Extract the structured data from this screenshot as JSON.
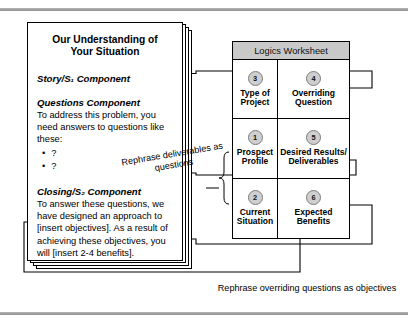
{
  "document": {
    "title": "Our Understanding of Your Situation",
    "sections": [
      {
        "heading": "Story/S₁ Component",
        "body": ""
      },
      {
        "heading": "Questions Component",
        "body": "To address this problem, you need answers to questions like these:",
        "bullets": [
          "?",
          "?"
        ]
      },
      {
        "heading": "Closing/S₂ Component",
        "body": "To answer these questions, we have designed an approach to [insert objectives]. As a result of achieving these objectives, you will [insert 2-4 benefits]."
      }
    ]
  },
  "worksheet": {
    "header": "Logics Worksheet",
    "cells": [
      {
        "number": "3",
        "label": "Type of Project"
      },
      {
        "number": "4",
        "label": "Overriding Question"
      },
      {
        "number": "1",
        "label": "Prospect Profile"
      },
      {
        "number": "5",
        "label": "Desired Results/ Deliverables"
      },
      {
        "number": "2",
        "label": "Current Situation"
      },
      {
        "number": "6",
        "label": "Expected Benefits"
      }
    ],
    "header_bg": "#c9c9c9",
    "badge_bg": "#cfcfcf"
  },
  "annotations": {
    "rephrase_deliverables": "Rephrase deliverables as questions",
    "rephrase_overriding": "Rephrase overriding questions as objectives"
  }
}
